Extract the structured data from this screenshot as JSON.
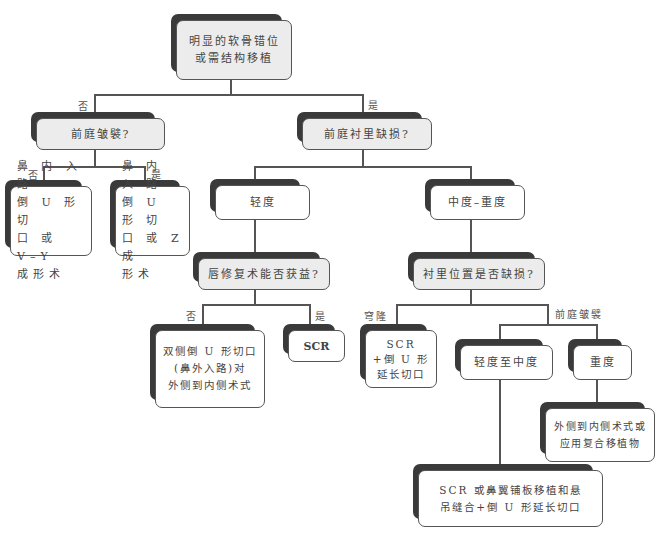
{
  "diagram": {
    "nodes": {
      "root": "明显的软骨错位\n或需结构移植",
      "vestibular_webbing_q": "前庭皱襞?",
      "vestibular_lining_defect_q": "前庭衬里缺损?",
      "leaf_no_webbing": "鼻 内 入 路\n倒 U 形 切\n口 或 V–Y\n成形术",
      "leaf_yes_webbing": "鼻 内 入 路\n倒 U 形 切\n口 或 Z 成\n形术",
      "mild": "轻度",
      "moderate_severe": "中度–重度",
      "lip_repair_benefit_q": "唇修复术能否获益?",
      "lining_location_defect_q": "衬里位置是否缺损?",
      "bilateral_inverted_u": "双侧倒 U 形切口\n(鼻外入路)对\n外侧到内侧术式",
      "scr": "SCR",
      "scr_inverted_u": "SCR\n+倒 U 形\n延长切口",
      "mild_to_moderate": "轻度至中度",
      "severe": "重度",
      "lateral_to_medial": "外侧到内侧术式或\n应用复合移植物",
      "scr_alar_flap": "SCR 或鼻翼铺板移植和悬\n吊缝合+倒 U 形延长切口"
    },
    "edge_labels": {
      "root_no": "否",
      "root_yes": "是",
      "webbing_no": "否",
      "webbing_yes": "是",
      "lip_no": "否",
      "lip_yes": "是",
      "dome": "穹隆",
      "vestibular_webbing": "前庭皱襞"
    },
    "colors": {
      "question_fill": "#ececec",
      "answer_fill": "#ffffff",
      "shadow": "#3a3a3a",
      "line": "#555555"
    }
  }
}
